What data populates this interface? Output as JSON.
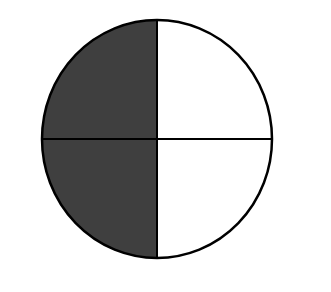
{
  "diagram": {
    "type": "fraction-circle",
    "parts_total": 4,
    "parts_shaded": 2,
    "shaded_quadrants": [
      "top-left",
      "bottom-left"
    ],
    "fraction": "2/4",
    "colors": {
      "shaded": "#3f3f3f",
      "unshaded": "#ffffff",
      "stroke": "#000000",
      "background": "#ffffff"
    }
  }
}
